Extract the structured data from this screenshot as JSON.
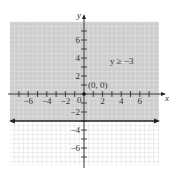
{
  "chart_data": {
    "type": "line",
    "title": "",
    "xlabel": "x",
    "ylabel": "y",
    "xlim": [
      -8,
      8
    ],
    "ylim": [
      -8,
      8
    ],
    "x_ticks": [
      "-6",
      "-4",
      "-2",
      "2",
      "4",
      "6"
    ],
    "y_ticks": [
      "6",
      "4",
      "2",
      "-2",
      "-4",
      "-6"
    ],
    "origin_label": "0",
    "grid": true,
    "series": [
      {
        "name": "boundary",
        "equation": "y = -3",
        "x": [
          -8,
          8
        ],
        "values": [
          -3,
          -3
        ],
        "style": "solid",
        "arrows": "both"
      }
    ],
    "shaded_region": {
      "inequality": "y ≥ -3",
      "color": "#c8c8c8"
    },
    "annotations": [
      {
        "text": "y ≥ −3",
        "x": 3.5,
        "y": 3.5
      },
      {
        "text": "(0, 0)",
        "x": 0.3,
        "y": 0.7,
        "point": [
          0,
          0
        ]
      }
    ]
  },
  "labels": {
    "x_axis": "x",
    "y_axis": "y",
    "inequality": "y ≥ −3",
    "test_point": "(0, 0)",
    "origin": "0",
    "xt": [
      "−6",
      "−4",
      "−2",
      "2",
      "4",
      "6"
    ],
    "yt": [
      "6",
      "4",
      "2",
      "−2",
      "−4",
      "−6"
    ]
  }
}
